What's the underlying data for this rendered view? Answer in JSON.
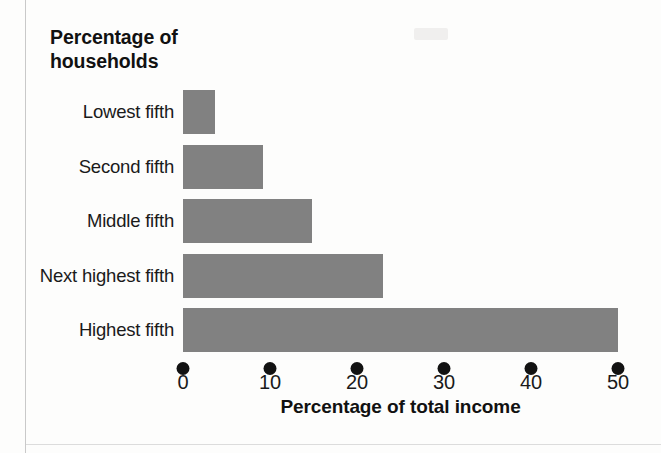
{
  "chart_data": {
    "type": "bar",
    "orientation": "horizontal",
    "title": "Percentage of households",
    "title_lines": [
      "Percentage of",
      "households"
    ],
    "xlabel": "Percentage of total income",
    "ylabel": "",
    "categories": [
      "Lowest fifth",
      "Second fifth",
      "Middle fifth",
      "Next highest fifth",
      "Highest fifth"
    ],
    "values": [
      3.7,
      9.2,
      14.8,
      23.0,
      50.0
    ],
    "xlim": [
      0,
      50
    ],
    "xticks": [
      0,
      10,
      20,
      30,
      40,
      50
    ],
    "xtick_labels": [
      "0",
      "10",
      "20",
      "30",
      "40",
      "50"
    ],
    "grid": false,
    "legend": null,
    "bar_color": "#818181",
    "tick_marker": "filled-circle",
    "tick_marker_color": "#121212",
    "background_color": "#fdfdfc",
    "text_color": "#1a1a1a"
  },
  "layout": {
    "axis_x0_px": 183,
    "axis_x50_px": 618,
    "bar_tops_px": [
      90,
      144.5,
      199,
      253.5,
      308
    ],
    "bar_height_px": 44,
    "dot_row_y_px": 362,
    "tick_label_y_px": 371
  }
}
